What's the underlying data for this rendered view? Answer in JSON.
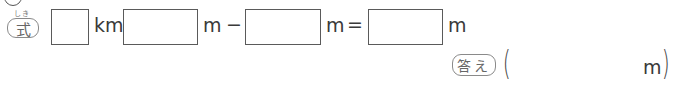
{
  "problem": {
    "formula_label": "式",
    "formula_ruby": "しき",
    "answer_label": "答え",
    "equation": {
      "boxes": [
        "",
        "",
        "",
        ""
      ],
      "unit_km": "km",
      "unit_m_1": "m",
      "operator_minus": "−",
      "unit_m_2": "m",
      "operator_equals": "=",
      "unit_m_3": "m"
    },
    "answer": {
      "open_paren": "(",
      "value": "",
      "unit": "m",
      "close_paren": ")"
    }
  }
}
